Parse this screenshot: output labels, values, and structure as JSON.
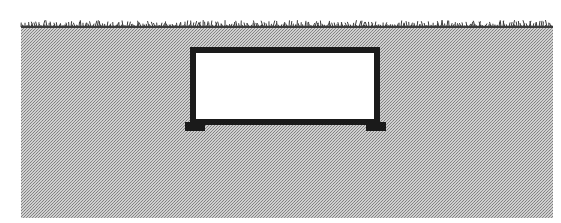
{
  "diagram": {
    "type": "cross-section",
    "colors": {
      "background": "#ffffff",
      "soil_light": "#c8c8c8",
      "soil_dark": "#8a8a8a",
      "grass": "#3a3a3a",
      "structure": "#1a1a1a",
      "opening": "#ffffff"
    },
    "ground": {
      "x": 21,
      "y": 25,
      "width": 532,
      "height": 193,
      "surface_label": "grass-surface"
    },
    "structure": {
      "outer_x": 190,
      "outer_y": 47,
      "outer_w": 190,
      "outer_h": 78,
      "wall": 6,
      "footing_left": {
        "x": 185,
        "y": 122,
        "w": 20,
        "h": 9
      },
      "footing_right": {
        "x": 366,
        "y": 122,
        "w": 20,
        "h": 9
      }
    }
  }
}
